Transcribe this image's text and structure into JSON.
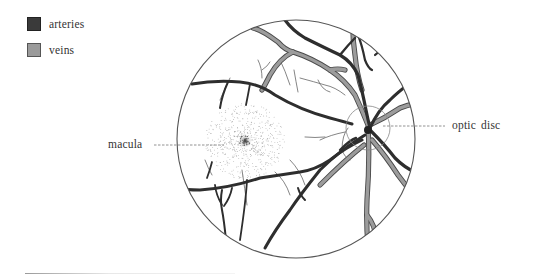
{
  "legend": {
    "items": [
      {
        "label": "arteries",
        "color": "#3a3a3a",
        "border": "#222222"
      },
      {
        "label": "veins",
        "color": "#9a9a9a",
        "border": "#555555"
      }
    ]
  },
  "labels": {
    "macula": "macula",
    "optic_disc": "optic disc"
  },
  "colors": {
    "artery": "#2e2e2e",
    "vein_fill": "#9c9c9c",
    "vein_edge": "#4a4a4a",
    "outline": "#555555",
    "leader": "#777777"
  }
}
